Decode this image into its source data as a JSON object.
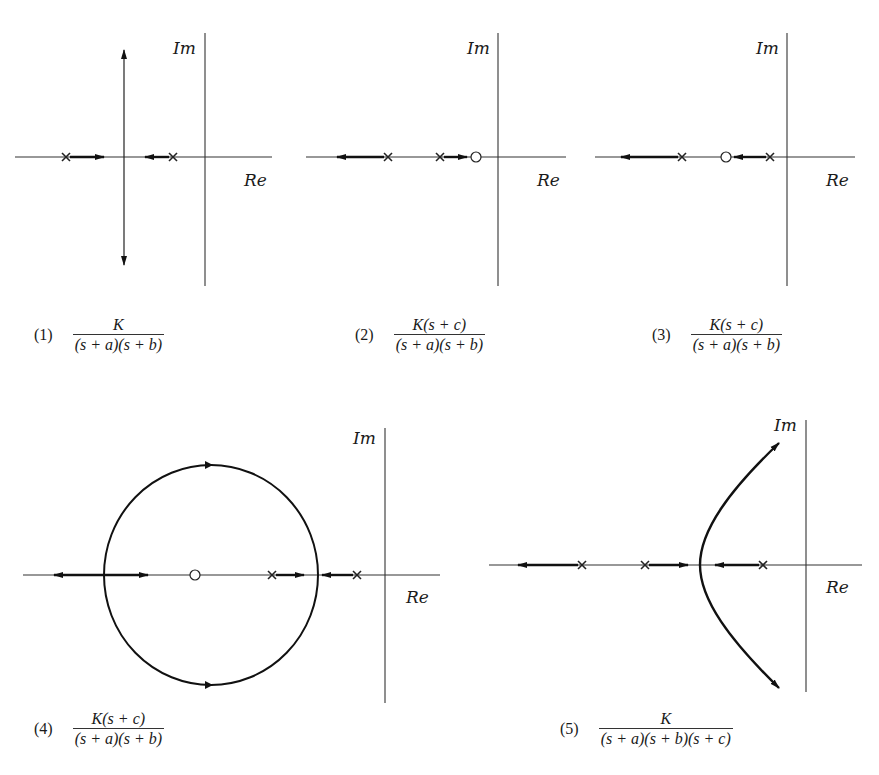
{
  "figure": {
    "axis_labels": {
      "real": "Re",
      "imag": "Im"
    },
    "colors": {
      "ink": "#1a1a1a",
      "background": "#ffffff"
    },
    "panels": [
      {
        "id": 1,
        "number": "(1)",
        "numerator": "K",
        "denominator": "(s + a)(s + b)",
        "poles": 2,
        "zeros": 0,
        "description": "Two real poles move toward each other, break away and go vertically to ±j∞"
      },
      {
        "id": 2,
        "number": "(2)",
        "numerator": "K(s + c)",
        "denominator": "(s + a)(s + b)",
        "poles": 2,
        "zeros": 1,
        "description": "Zero right of both poles: one branch goes to the zero, other to −∞"
      },
      {
        "id": 3,
        "number": "(3)",
        "numerator": "K(s + c)",
        "denominator": "(s + a)(s + b)",
        "poles": 2,
        "zeros": 1,
        "description": "Zero between the poles: right pole goes to the zero, left pole to −∞"
      },
      {
        "id": 4,
        "number": "(4)",
        "numerator": "K(s + c)",
        "denominator": "(s + a)(s + b)",
        "poles": 2,
        "zeros": 1,
        "description": "Zero left of both poles: break-away then circle around zero, break-in to real axis"
      },
      {
        "id": 5,
        "number": "(5)",
        "numerator": "K",
        "denominator": "(s + a)(s + b)(s + c)",
        "poles": 3,
        "zeros": 0,
        "description": "Three real poles: one branch to −∞, two break away and follow asymptotes into RHP"
      }
    ]
  }
}
